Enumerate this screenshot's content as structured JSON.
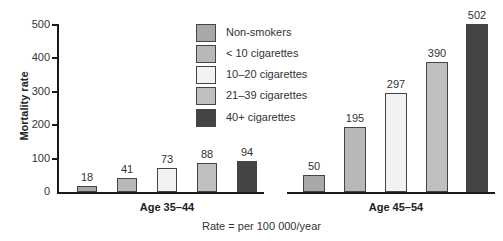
{
  "chart_data": {
    "type": "bar",
    "title": "",
    "xlabel": "Rate = per 100 000/year",
    "ylabel": "Mortality rate",
    "ylim": [
      0,
      500
    ],
    "yticks": [
      0,
      100,
      200,
      300,
      400,
      500
    ],
    "grid": false,
    "legend_position": "top-center",
    "categories": [
      "Age 35–44",
      "Age 45–54"
    ],
    "series": [
      {
        "name": "Non-smokers",
        "color": "#a8a8a8",
        "values": [
          18,
          50
        ]
      },
      {
        "name": "< 10 cigarettes",
        "color": "#b8b8b8",
        "values": [
          41,
          195
        ]
      },
      {
        "name": "10–20 cigarettes",
        "color": "#f2f2f2",
        "values": [
          73,
          297
        ]
      },
      {
        "name": "21–39 cigarettes",
        "color": "#c0c0c0",
        "values": [
          88,
          390
        ]
      },
      {
        "name": "40+ cigarettes",
        "color": "#444444",
        "values": [
          94,
          502
        ]
      }
    ]
  },
  "axis": {
    "ylabel": "Mortality rate",
    "ticks": [
      "0",
      "100",
      "200",
      "300",
      "400",
      "500"
    ]
  },
  "legend": [
    {
      "label": "Non-smokers",
      "color": "#a8a8a8"
    },
    {
      "label": "< 10 cigarettes",
      "color": "#b8b8b8"
    },
    {
      "label": "10–20 cigarettes",
      "color": "#f2f2f2"
    },
    {
      "label": "21–39 cigarettes",
      "color": "#c0c0c0"
    },
    {
      "label": "40+ cigarettes",
      "color": "#444444"
    }
  ],
  "groups": [
    {
      "label": "Age 35–44",
      "values": [
        "18",
        "41",
        "73",
        "88",
        "94"
      ]
    },
    {
      "label": "Age 45–54",
      "values": [
        "50",
        "195",
        "297",
        "390",
        "502"
      ]
    }
  ],
  "note": "Rate = per 100 000/year"
}
